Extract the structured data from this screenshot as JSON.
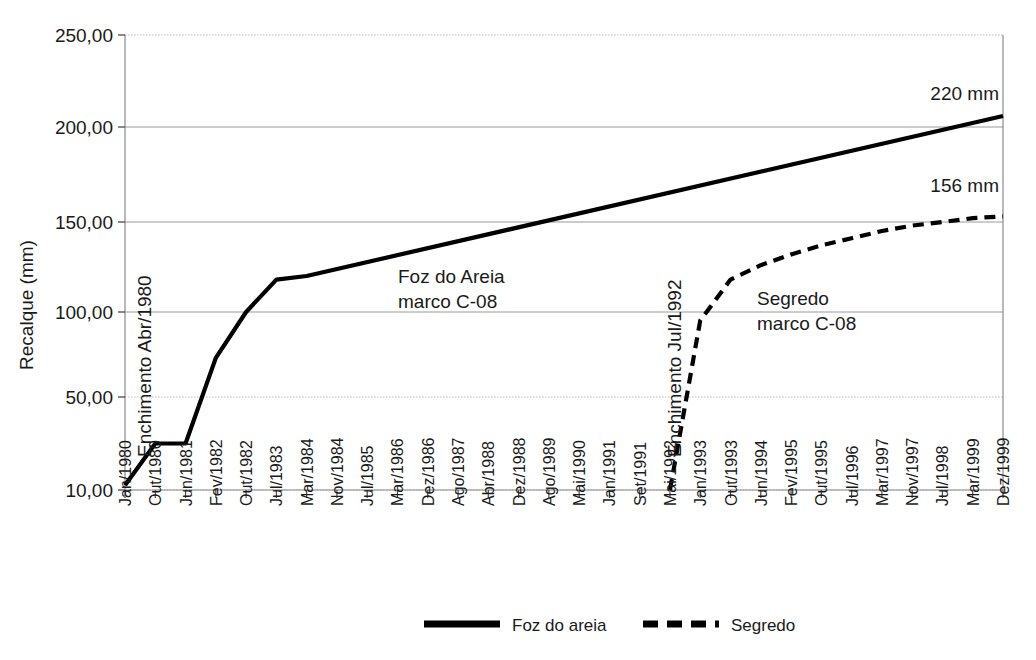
{
  "chart_data": {
    "type": "line",
    "title": "",
    "xlabel": "",
    "ylabel": "Recalque (mm)",
    "ylim": [
      10,
      250
    ],
    "yticks": [
      "10,00",
      "50,00",
      "100,00",
      "150,00",
      "200,00",
      "250,00"
    ],
    "ytick_values": [
      10,
      50,
      100,
      150,
      200,
      250
    ],
    "grid": true,
    "legend_position": "bottom",
    "categories": [
      "Jan/1980",
      "Out/1980",
      "Jun/1981",
      "Fev/1982",
      "Out/1982",
      "Jul/1983",
      "Mar/1984",
      "Nov/1984",
      "Jul/1985",
      "Mar/1986",
      "Dez/1986",
      "Ago/1987",
      "Abr/1988",
      "Dez/1988",
      "Ago/1989",
      "Mai/1990",
      "Jan/1991",
      "Set/1991",
      "Mai/1992",
      "Jan/1993",
      "Out/1993",
      "Jun/1994",
      "Fev/1995",
      "Out/1995",
      "Jul/1996",
      "Mar/1997",
      "Nov/1997",
      "Jul/1998",
      "Mar/1999",
      "Dez/1999"
    ],
    "series": [
      {
        "name": "Foz do areia",
        "style": "solid",
        "color": "#000000",
        "points": [
          {
            "x": "Jan/1980",
            "y": 12
          },
          {
            "x": "Out/1980",
            "y": 30
          },
          {
            "x": "Jun/1981",
            "y": 30
          },
          {
            "x": "Fev/1982",
            "y": 73
          },
          {
            "x": "Out/1982",
            "y": 100
          },
          {
            "x": "Jul/1983",
            "y": 118
          },
          {
            "x": "Mar/1984",
            "y": 120
          },
          {
            "x": "Dez/1999",
            "y": 206
          }
        ]
      },
      {
        "name": "Segredo",
        "style": "dashed",
        "color": "#000000",
        "points": [
          {
            "x": "Mai/1992",
            "y": 10
          },
          {
            "x": "Jan/1993",
            "y": 95
          },
          {
            "x": "Out/1993",
            "y": 118
          },
          {
            "x": "Jun/1994",
            "y": 126
          },
          {
            "x": "Fev/1995",
            "y": 132
          },
          {
            "x": "Out/1995",
            "y": 137
          },
          {
            "x": "Jul/1996",
            "y": 141
          },
          {
            "x": "Mar/1997",
            "y": 145
          },
          {
            "x": "Nov/1997",
            "y": 148
          },
          {
            "x": "Jul/1998",
            "y": 150
          },
          {
            "x": "Mar/1999",
            "y": 152
          },
          {
            "x": "Dez/1999",
            "y": 153
          }
        ]
      }
    ],
    "annotations": [
      {
        "name": "enchimento-foz",
        "text": "Enchimento Abr/1980",
        "orientation": "vertical"
      },
      {
        "name": "enchimento-segredo",
        "text": "Enchimento Jul/1992",
        "orientation": "vertical"
      },
      {
        "name": "foz-marco-line1",
        "text": "Foz do Areia",
        "orientation": "horizontal"
      },
      {
        "name": "foz-marco-line2",
        "text": "marco C-08",
        "orientation": "horizontal"
      },
      {
        "name": "segredo-marco-line1",
        "text": "Segredo",
        "orientation": "horizontal"
      },
      {
        "name": "segredo-marco-line2",
        "text": "marco C-08",
        "orientation": "horizontal"
      },
      {
        "name": "foz-end-value",
        "text": "220 mm",
        "orientation": "horizontal"
      },
      {
        "name": "segredo-end-value",
        "text": "156 mm",
        "orientation": "horizontal"
      }
    ],
    "legend": [
      {
        "label": "Foz do areia",
        "style": "solid"
      },
      {
        "label": "Segredo",
        "style": "dashed"
      }
    ]
  }
}
